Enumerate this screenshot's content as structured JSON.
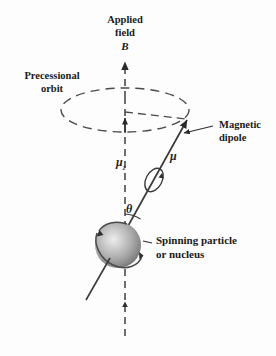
{
  "figure": {
    "title_lines": [
      "Applied",
      "field"
    ],
    "field_symbol": "B",
    "labels": {
      "applied_field_l1": "Applied",
      "applied_field_l2": "field",
      "field_vector": "B",
      "precessional_l1": "Precessional",
      "precessional_l2": "orbit",
      "mu_z_main": "μ",
      "mu_z_sub": "z",
      "mu": "μ",
      "theta": "θ",
      "magnetic_dipole_l1": "Magnetic",
      "magnetic_dipole_l2": "dipole",
      "spinning_l1": "Spinning particle",
      "spinning_l2": "or nucleus"
    },
    "colors": {
      "ink": "#1a1a1a",
      "line": "#3a3a3a",
      "dashed": "#4a4a4a",
      "sphere_light": "#e8e8e8",
      "sphere_mid": "#a8a8a8",
      "sphere_dark": "#6e6e6e",
      "background": "#fdfdfd"
    },
    "geometry": {
      "axis_x": 125,
      "axis_top_y": 58,
      "axis_bottom_y": 336,
      "ellipse_cx": 125,
      "ellipse_cy": 110,
      "ellipse_rx": 64,
      "ellipse_ry": 22,
      "mu_tip_x": 188,
      "mu_tip_y": 118,
      "sphere_cx": 118,
      "sphere_cy": 245,
      "sphere_r": 23,
      "theta_degrees": 30
    }
  }
}
